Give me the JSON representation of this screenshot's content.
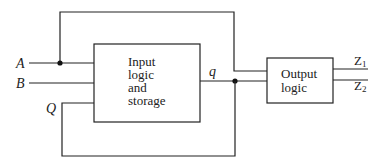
{
  "diagram": {
    "inputs": [
      {
        "label": "A"
      },
      {
        "label": "B"
      },
      {
        "label": "Q"
      }
    ],
    "input_block": {
      "lines": [
        "Input",
        "logic",
        "and",
        "storage"
      ]
    },
    "internal_signal": {
      "label": "q"
    },
    "output_block": {
      "lines": [
        "Output",
        "logic"
      ]
    },
    "outputs": [
      {
        "label": "Z",
        "sub": "1"
      },
      {
        "label": "Z",
        "sub": "2"
      }
    ],
    "colors": {
      "line": "#222222",
      "background": "#ffffff"
    }
  }
}
